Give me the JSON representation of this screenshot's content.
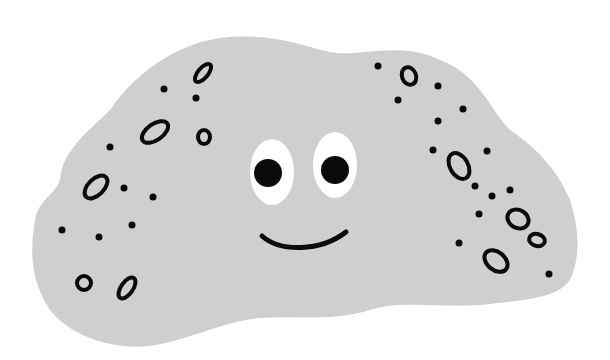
{
  "illustration": {
    "subject": "smiling gray rock",
    "colors": {
      "background": "#ffffff",
      "body": "#cfcfcf",
      "outline": "#0a0a0a",
      "eye_white": "#ffffff",
      "pupil": "#0a0a0a"
    },
    "face": {
      "left_eye": {
        "cx": 272,
        "cy": 172,
        "rx": 22,
        "ry": 33,
        "pupil_r": 14
      },
      "right_eye": {
        "cx": 335,
        "cy": 165,
        "rx": 22,
        "ry": 33,
        "pupil_r": 14
      },
      "mouth": "smile"
    },
    "rings": [
      {
        "cx": 203,
        "cy": 73,
        "rx": 5,
        "ry": 11,
        "rot": 40
      },
      {
        "cx": 155,
        "cy": 132,
        "rx": 8,
        "ry": 15,
        "rot": 55
      },
      {
        "cx": 204,
        "cy": 137,
        "rx": 6,
        "ry": 7,
        "rot": 0
      },
      {
        "cx": 96,
        "cy": 187,
        "rx": 8,
        "ry": 14,
        "rot": 45
      },
      {
        "cx": 84,
        "cy": 283,
        "rx": 7,
        "ry": 7,
        "rot": 0
      },
      {
        "cx": 127,
        "cy": 288,
        "rx": 6,
        "ry": 12,
        "rot": 35
      },
      {
        "cx": 409,
        "cy": 76,
        "rx": 7,
        "ry": 9,
        "rot": -20
      },
      {
        "cx": 459,
        "cy": 166,
        "rx": 9,
        "ry": 14,
        "rot": -30
      },
      {
        "cx": 518,
        "cy": 219,
        "rx": 11,
        "ry": 9,
        "rot": 30
      },
      {
        "cx": 537,
        "cy": 240,
        "rx": 8,
        "ry": 6,
        "rot": 15
      },
      {
        "cx": 496,
        "cy": 261,
        "rx": 13,
        "ry": 9,
        "rot": 40
      }
    ],
    "dots": [
      [
        164,
        89
      ],
      [
        196,
        98
      ],
      [
        110,
        147
      ],
      [
        124,
        188
      ],
      [
        153,
        197
      ],
      [
        62,
        230
      ],
      [
        99,
        237
      ],
      [
        132,
        225
      ],
      [
        378,
        66
      ],
      [
        438,
        86
      ],
      [
        398,
        100
      ],
      [
        463,
        109
      ],
      [
        438,
        121
      ],
      [
        433,
        150
      ],
      [
        487,
        151
      ],
      [
        475,
        186
      ],
      [
        492,
        196
      ],
      [
        510,
        190
      ],
      [
        479,
        214
      ],
      [
        459,
        243
      ],
      [
        549,
        274
      ]
    ]
  }
}
